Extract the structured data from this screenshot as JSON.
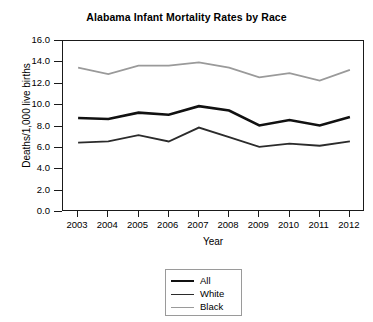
{
  "chart_data": {
    "type": "line",
    "title": "Alabama Infant Mortality Rates by Race",
    "xlabel": "Year",
    "ylabel": "Deaths/1,000 live births",
    "x": [
      2003,
      2004,
      2005,
      2006,
      2007,
      2008,
      2009,
      2010,
      2011,
      2012
    ],
    "categories": [
      "2003",
      "2004",
      "2005",
      "2006",
      "2007",
      "2008",
      "2009",
      "2010",
      "2011",
      "2012"
    ],
    "series": [
      {
        "name": "All",
        "color": "#111111",
        "width": 2.6,
        "values": [
          8.8,
          8.7,
          9.3,
          9.1,
          9.9,
          9.5,
          8.1,
          8.6,
          8.1,
          8.9
        ]
      },
      {
        "name": "White",
        "color": "#2b2b2b",
        "width": 1.8,
        "values": [
          6.5,
          6.6,
          7.2,
          6.6,
          7.9,
          7.0,
          6.1,
          6.4,
          6.2,
          6.6
        ]
      },
      {
        "name": "Black",
        "color": "#9a9a9a",
        "width": 1.8,
        "values": [
          13.5,
          12.9,
          13.7,
          13.7,
          14.0,
          13.5,
          12.6,
          13.0,
          12.3,
          13.3
        ]
      }
    ],
    "ylim": [
      0.0,
      16.0
    ],
    "yticks": [
      0.0,
      2.0,
      4.0,
      6.0,
      8.0,
      10.0,
      12.0,
      14.0,
      16.0
    ],
    "ytick_labels": [
      "0.0",
      "2.0",
      "4.0",
      "6.0",
      "8.0",
      "10.0",
      "12.0",
      "14.0",
      "16.0"
    ],
    "grid": false,
    "legend_position": "bottom-center",
    "legend_entries": [
      "All",
      "White",
      "Black"
    ]
  }
}
